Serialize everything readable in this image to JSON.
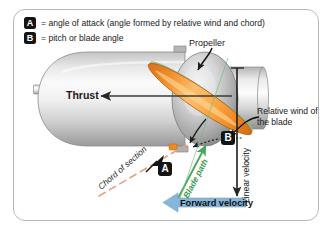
{
  "figure": {
    "frame_color": "#b9b9b9",
    "background": "#ffffff"
  },
  "legend": {
    "items": [
      {
        "badge": "A",
        "text": "= angle of attack (angle formed by relative wind and chord)"
      },
      {
        "badge": "B",
        "text": "= pitch or blade angle"
      }
    ]
  },
  "markers": {
    "a": "A",
    "b": "B"
  },
  "labels": {
    "propeller": "Propeller",
    "thrust": "Thrust",
    "relative_wind": "Relative wind of the blade",
    "chord_of_section": "Chord of section",
    "blade_path": "Blade path",
    "forward_velocity": "Forward velocity",
    "linear_velocity": "Linear velocity"
  },
  "colors": {
    "blade_orange": "#f5912e",
    "blade_orange_light": "#fcc06a",
    "blade_outline": "#8a4a10",
    "blade_path_green": "#4aa85e",
    "forward_velocity_blue": "#7fb4d6",
    "chord_salmon": "#e2a183",
    "nacelle_gray_light": "#f2f2f2",
    "nacelle_gray_mid": "#c9c9c9",
    "nacelle_gray_dark": "#8f8f8f",
    "arrow_black": "#2a2a2a",
    "badge_bg": "#141414",
    "badge_fg": "#ffffff"
  }
}
